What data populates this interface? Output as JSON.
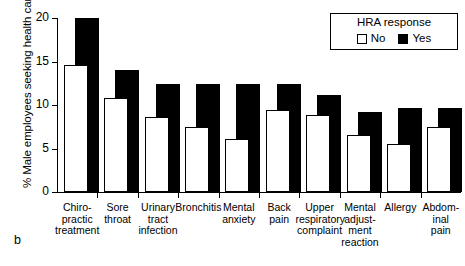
{
  "panel": {
    "letter": "b"
  },
  "legend": {
    "title": "HRA response",
    "items": [
      {
        "label": "No",
        "swatch": "white-square-icon",
        "color": "#ffffff"
      },
      {
        "label": "Yes",
        "swatch": "black-square-icon",
        "color": "#000000"
      }
    ]
  },
  "chart_data": {
    "type": "bar",
    "title": "",
    "xlabel": "",
    "ylabel": "% Male employees seeking health care",
    "ylim": [
      0,
      20
    ],
    "yticks": [
      0,
      5,
      10,
      15,
      20
    ],
    "ytick_labels": [
      "0",
      "5",
      "10",
      "15",
      "20"
    ],
    "grid": false,
    "legend_position": "top-right",
    "legend_title": "HRA response",
    "categories": [
      "Chiro-\npractic\ntreatment",
      "Sore\nthroat",
      "Urinary\ntract\ninfection",
      "Bronchitis",
      "Mental\nanxiety",
      "Back\npain",
      "Upper\nrespiratory\ncomplaint",
      "Mental\nadjust-\nment\nreaction",
      "Allergy",
      "Abdom-\ninal\npain"
    ],
    "series": [
      {
        "name": "No",
        "color": "#ffffff",
        "values": [
          14.6,
          10.8,
          8.6,
          7.5,
          6.1,
          9.4,
          8.8,
          6.6,
          5.5,
          7.5
        ]
      },
      {
        "name": "Yes",
        "color": "#000000",
        "values": [
          20.0,
          14.0,
          12.4,
          12.4,
          12.4,
          12.4,
          11.1,
          9.2,
          9.6,
          9.6
        ]
      }
    ]
  }
}
